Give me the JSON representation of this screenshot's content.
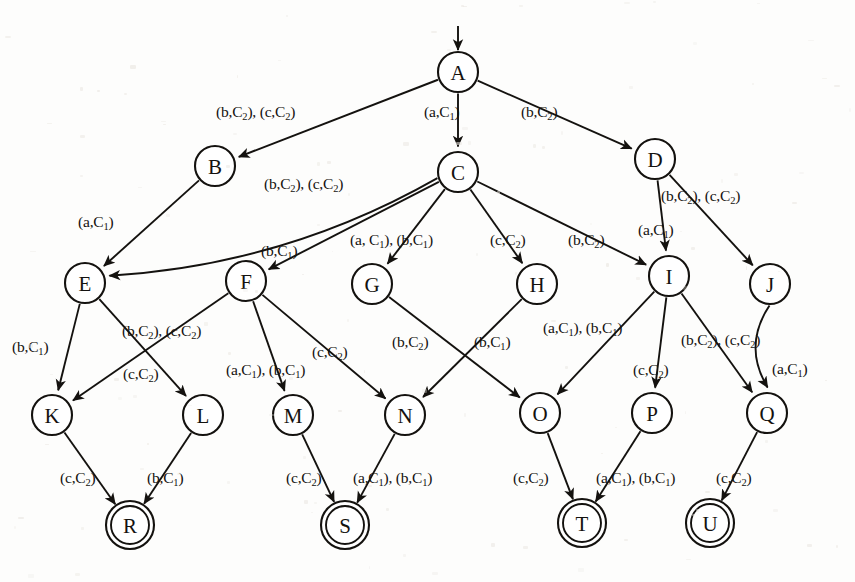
{
  "diagram": {
    "alphabet": [
      "a",
      "b",
      "c"
    ],
    "costs": [
      "C1",
      "C2"
    ],
    "start_node": "A",
    "accepting_nodes": [
      "R",
      "S",
      "T",
      "U"
    ],
    "stroke_color": "#14120f",
    "background_color": "#fdfdfc"
  },
  "nodes": [
    {
      "id": "A",
      "label": "A",
      "x": 458,
      "y": 72,
      "r": 20,
      "accepting": false,
      "start": true
    },
    {
      "id": "B",
      "label": "B",
      "x": 215,
      "y": 166,
      "r": 20,
      "accepting": false,
      "start": false
    },
    {
      "id": "C",
      "label": "C",
      "x": 458,
      "y": 172,
      "r": 20,
      "accepting": false,
      "start": false
    },
    {
      "id": "D",
      "label": "D",
      "x": 655,
      "y": 159,
      "r": 20,
      "accepting": false,
      "start": false
    },
    {
      "id": "E",
      "label": "E",
      "x": 85,
      "y": 283,
      "r": 20,
      "accepting": false,
      "start": false
    },
    {
      "id": "F",
      "label": "F",
      "x": 246,
      "y": 281,
      "r": 20,
      "accepting": false,
      "start": false
    },
    {
      "id": "G",
      "label": "G",
      "x": 372,
      "y": 284,
      "r": 20,
      "accepting": false,
      "start": false
    },
    {
      "id": "H",
      "label": "H",
      "x": 537,
      "y": 284,
      "r": 20,
      "accepting": false,
      "start": false
    },
    {
      "id": "I",
      "label": "I",
      "x": 669,
      "y": 276,
      "r": 20,
      "accepting": false,
      "start": false
    },
    {
      "id": "J",
      "label": "J",
      "x": 770,
      "y": 284,
      "r": 20,
      "accepting": false,
      "start": false
    },
    {
      "id": "K",
      "label": "K",
      "x": 52,
      "y": 415,
      "r": 20,
      "accepting": false,
      "start": false
    },
    {
      "id": "L",
      "label": "L",
      "x": 203,
      "y": 415,
      "r": 20,
      "accepting": false,
      "start": false
    },
    {
      "id": "M",
      "label": "M",
      "x": 293,
      "y": 415,
      "r": 20,
      "accepting": false,
      "start": false
    },
    {
      "id": "N",
      "label": "N",
      "x": 405,
      "y": 415,
      "r": 20,
      "accepting": false,
      "start": false
    },
    {
      "id": "O",
      "label": "O",
      "x": 540,
      "y": 413,
      "r": 20,
      "accepting": false,
      "start": false
    },
    {
      "id": "P",
      "label": "P",
      "x": 652,
      "y": 413,
      "r": 20,
      "accepting": false,
      "start": false
    },
    {
      "id": "Q",
      "label": "Q",
      "x": 767,
      "y": 413,
      "r": 20,
      "accepting": false,
      "start": false
    },
    {
      "id": "R",
      "label": "R",
      "x": 130,
      "y": 525,
      "r": 20,
      "accepting": true,
      "start": false
    },
    {
      "id": "S",
      "label": "S",
      "x": 345,
      "y": 525,
      "r": 20,
      "accepting": true,
      "start": false
    },
    {
      "id": "T",
      "label": "T",
      "x": 582,
      "y": 523,
      "r": 20,
      "accepting": true,
      "start": false
    },
    {
      "id": "U",
      "label": "U",
      "x": 710,
      "y": 523,
      "r": 20,
      "accepting": true,
      "start": false
    }
  ],
  "edges": [
    {
      "from": "A",
      "to": "B",
      "label": "(b,C2), (c,C2)",
      "label_x": 216,
      "label_y": 104,
      "curve": 0
    },
    {
      "from": "A",
      "to": "C",
      "label": "(a,C1)",
      "label_x": 424,
      "label_y": 104,
      "curve": 0
    },
    {
      "from": "A",
      "to": "D",
      "label": "(b,C2)",
      "label_x": 521,
      "label_y": 104,
      "curve": 0
    },
    {
      "from": "B",
      "to": "E",
      "label": "(a,C1)",
      "label_x": 78,
      "label_y": 214,
      "curve": 0
    },
    {
      "from": "C",
      "to": "E",
      "label": "(b,C2), (c,C2)",
      "label_x": 264,
      "label_y": 176,
      "curve": -40
    },
    {
      "from": "C",
      "to": "F",
      "label": "(b,C1)",
      "label_x": 261,
      "label_y": 243,
      "curve": 0
    },
    {
      "from": "C",
      "to": "G",
      "label": "(a, C1), (b,C1)",
      "label_x": 350,
      "label_y": 232,
      "curve": 0
    },
    {
      "from": "C",
      "to": "H",
      "label": "(c,C2)",
      "label_x": 490,
      "label_y": 232,
      "curve": 0
    },
    {
      "from": "C",
      "to": "I",
      "label": "(b,C2)",
      "label_x": 568,
      "label_y": 232,
      "curve": 0
    },
    {
      "from": "D",
      "to": "I",
      "label": "(a,C1)",
      "label_x": 638,
      "label_y": 222,
      "curve": 0
    },
    {
      "from": "D",
      "to": "J",
      "label": "(b,C2), (c,C2)",
      "label_x": 661,
      "label_y": 188,
      "curve": 0
    },
    {
      "from": "E",
      "to": "K",
      "label": "(b,C1)",
      "label_x": 12,
      "label_y": 339,
      "curve": 0
    },
    {
      "from": "E",
      "to": "L",
      "label": "(c,C2)",
      "label_x": 123,
      "label_y": 366,
      "curve": 0
    },
    {
      "from": "F",
      "to": "K",
      "label": "(b,C2), (c,C2)",
      "label_x": 122,
      "label_y": 323,
      "curve": 0
    },
    {
      "from": "F",
      "to": "M",
      "label": "(a,C1), (b,C1)",
      "label_x": 226,
      "label_y": 362,
      "curve": 0
    },
    {
      "from": "F",
      "to": "N",
      "label": "(c,C2)",
      "label_x": 312,
      "label_y": 344,
      "curve": 0
    },
    {
      "from": "G",
      "to": "O",
      "label": "(b,C2)",
      "label_x": 392,
      "label_y": 334,
      "curve": 0
    },
    {
      "from": "H",
      "to": "N",
      "label": "(b,C1)",
      "label_x": 474,
      "label_y": 334,
      "curve": 0
    },
    {
      "from": "I",
      "to": "O",
      "label": "(a,C1), (b,C1)",
      "label_x": 543,
      "label_y": 320,
      "curve": 0
    },
    {
      "from": "I",
      "to": "P",
      "label": "(c,C2)",
      "label_x": 633,
      "label_y": 362,
      "curve": 0
    },
    {
      "from": "I",
      "to": "Q",
      "label": "(b,C2), (c,C2)",
      "label_x": 681,
      "label_y": 332,
      "curve": 0
    },
    {
      "from": "J",
      "to": "Q",
      "label": "(a,C1)",
      "label_x": 772,
      "label_y": 361,
      "curve": 26
    },
    {
      "from": "K",
      "to": "R",
      "label": "(c,C2)",
      "label_x": 60,
      "label_y": 470,
      "curve": 0
    },
    {
      "from": "L",
      "to": "R",
      "label": "(b,C1)",
      "label_x": 147,
      "label_y": 470,
      "curve": 0
    },
    {
      "from": "M",
      "to": "S",
      "label": "(c,C2)",
      "label_x": 286,
      "label_y": 470,
      "curve": 0
    },
    {
      "from": "N",
      "to": "S",
      "label": "(a,C1), (b,C1)",
      "label_x": 353,
      "label_y": 470,
      "curve": 0
    },
    {
      "from": "O",
      "to": "T",
      "label": "(c,C2)",
      "label_x": 513,
      "label_y": 470,
      "curve": 0
    },
    {
      "from": "P",
      "to": "T",
      "label": "(a,C1), (b,C1)",
      "label_x": 596,
      "label_y": 470,
      "curve": 0
    },
    {
      "from": "Q",
      "to": "U",
      "label": "(c,C2)",
      "label_x": 716,
      "label_y": 470,
      "curve": 0
    }
  ],
  "start_arrow": {
    "from_x": 458,
    "from_y": 26,
    "to_x": 458,
    "to_y": 50
  }
}
